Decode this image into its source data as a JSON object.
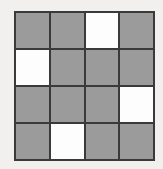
{
  "board": {
    "rows": 4,
    "cols": 4,
    "cells": [
      [
        "gray",
        "gray",
        "white",
        "gray"
      ],
      [
        "white",
        "gray",
        "gray",
        "gray"
      ],
      [
        "gray",
        "gray",
        "gray",
        "white"
      ],
      [
        "gray",
        "white",
        "gray",
        "gray"
      ]
    ]
  },
  "colors": {
    "gray": "#9b9b9b",
    "white": "#fdfdfd",
    "grid_line": "#3a3a3a",
    "page_background": "#f2f0ee"
  }
}
